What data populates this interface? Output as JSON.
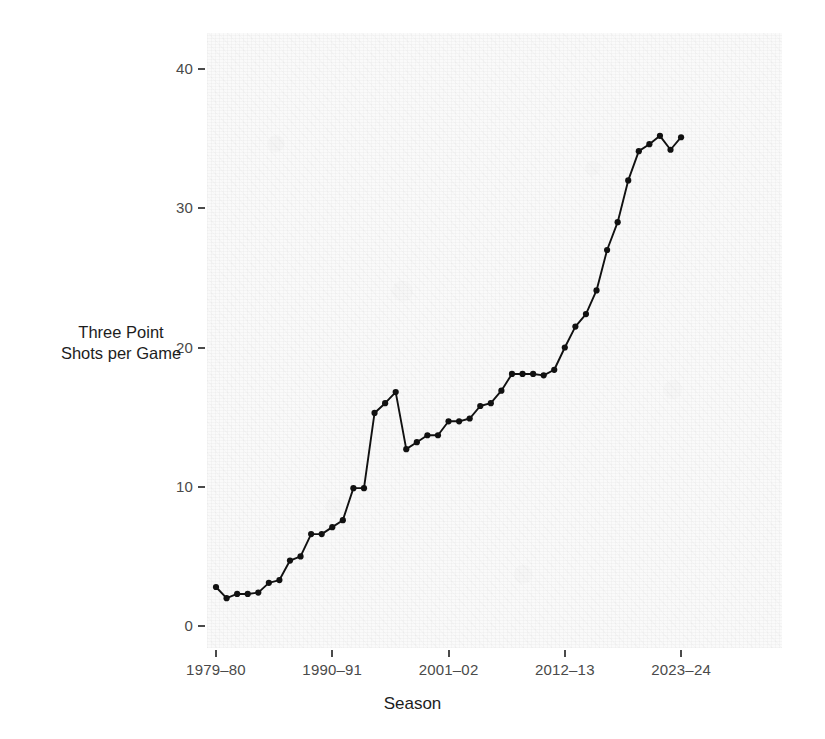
{
  "chart_data": {
    "type": "line",
    "title": "",
    "xlabel": "Season",
    "ylabel": "Three Point Shots per Game",
    "ylabel_line1": "Three Point",
    "ylabel_line2": "Shots per Game",
    "grid": false,
    "legend": false,
    "marker": "filled-circle",
    "line_color": "#111111",
    "marker_color": "#111111",
    "panel_background": "#fafafa",
    "ylim": [
      -1.5,
      42.5
    ],
    "yticks": [
      0,
      10,
      20,
      30,
      40
    ],
    "ytick_labels": [
      "0",
      "10",
      "20",
      "30",
      "40"
    ],
    "xticks": [
      "1979-80",
      "1990-91",
      "2001-02",
      "2012-13",
      "2023-24"
    ],
    "xtick_labels": [
      "1979–80",
      "1990–91",
      "2001–02",
      "2012–13",
      "2023–24"
    ],
    "categories": [
      "1979-80",
      "1980-81",
      "1981-82",
      "1982-83",
      "1983-84",
      "1984-85",
      "1985-86",
      "1986-87",
      "1987-88",
      "1988-89",
      "1989-90",
      "1990-91",
      "1991-92",
      "1992-93",
      "1993-94",
      "1994-95",
      "1995-96",
      "1996-97",
      "1997-98",
      "1998-99",
      "1999-00",
      "2000-01",
      "2001-02",
      "2002-03",
      "2003-04",
      "2004-05",
      "2005-06",
      "2006-07",
      "2007-08",
      "2008-09",
      "2009-10",
      "2010-11",
      "2011-12",
      "2012-13",
      "2013-14",
      "2014-15",
      "2015-16",
      "2016-17",
      "2017-18",
      "2018-19",
      "2019-20",
      "2020-21",
      "2021-22",
      "2022-23",
      "2023-24"
    ],
    "values": [
      2.8,
      2.0,
      2.3,
      2.3,
      2.4,
      3.1,
      3.3,
      4.7,
      5.0,
      6.6,
      6.6,
      7.1,
      7.6,
      9.9,
      9.9,
      15.3,
      16.0,
      16.8,
      12.7,
      13.2,
      13.7,
      13.7,
      14.7,
      14.7,
      14.9,
      15.8,
      16.0,
      16.9,
      18.1,
      18.1,
      18.1,
      18.0,
      18.4,
      20.0,
      21.5,
      22.4,
      24.1,
      27.0,
      29.0,
      32.0,
      34.1,
      34.6,
      35.2,
      34.2,
      35.1
    ],
    "annotations": []
  },
  "axes": {
    "y_axis_name": "three-point-shots-per-game-axis",
    "x_axis_name": "season-axis"
  }
}
